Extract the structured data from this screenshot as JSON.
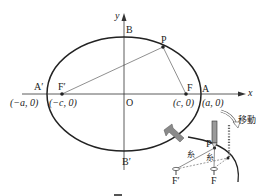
{
  "diagram": {
    "type": "ellipse-focus-construction",
    "axes": {
      "x_label": "x",
      "y_label": "y",
      "origin_label": "O"
    },
    "ellipse": {
      "center": [
        124,
        94
      ],
      "rx": 77,
      "ry": 57,
      "stroke": "#222222"
    },
    "points": {
      "A_prime": {
        "label": "A′",
        "coord": "(−a, 0)"
      },
      "F_prime": {
        "label": "F′",
        "coord": "(−c, 0)"
      },
      "F": {
        "label": "F",
        "coord": "(c, 0)"
      },
      "A": {
        "label": "A",
        "coord": "(a, 0)"
      },
      "B": {
        "label": "B"
      },
      "B_prime": {
        "label": "B′"
      },
      "P": {
        "label": "P"
      }
    },
    "inset": {
      "move_label": "移動",
      "string_label_1": "糸",
      "string_label_2": "糸",
      "P_label": "P",
      "F_prime_label": "F′",
      "F_label": "F",
      "arrow_color": "#8a8a8a",
      "pencil_color": "#9a9a9a"
    },
    "caption": {
      "partial": true
    }
  }
}
